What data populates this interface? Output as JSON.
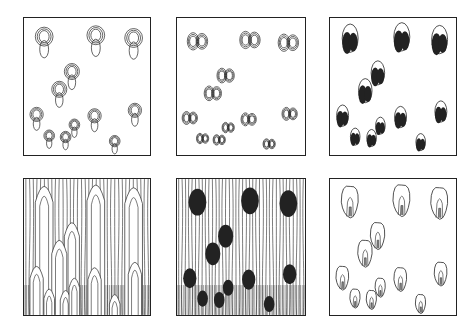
{
  "figure": {
    "rows": 2,
    "cols": 3,
    "panels": [
      {
        "id": "top-left",
        "style": "nested open contours, elongated vertical pairs"
      },
      {
        "id": "top-middle",
        "style": "nested contours, bilobed heart shapes"
      },
      {
        "id": "top-right",
        "style": "filled black bilobed blobs with open outlines"
      },
      {
        "id": "bottom-left",
        "style": "vertical field lines with nested finger shapes, dense at bottom"
      },
      {
        "id": "bottom-middle",
        "style": "vertical field lines with filled black blobs"
      },
      {
        "id": "bottom-right",
        "style": "outlined teardrop shapes with inner nested lines"
      }
    ],
    "blob_positions": [
      [
        0.16,
        0.17
      ],
      [
        0.57,
        0.16
      ],
      [
        0.87,
        0.18
      ],
      [
        0.38,
        0.42
      ],
      [
        0.28,
        0.55
      ],
      [
        0.1,
        0.73
      ],
      [
        0.56,
        0.74
      ],
      [
        0.88,
        0.7
      ],
      [
        0.2,
        0.88
      ],
      [
        0.33,
        0.89
      ],
      [
        0.4,
        0.8
      ],
      [
        0.72,
        0.92
      ]
    ],
    "colors": {
      "ink": "#222222",
      "background": "#ffffff"
    }
  }
}
